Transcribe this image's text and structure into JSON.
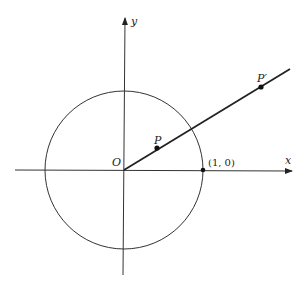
{
  "diagram": {
    "type": "unit-circle-with-ray",
    "axes": {
      "x_label": "x",
      "y_label": "y"
    },
    "origin_label": "O",
    "circle": {
      "center": "O",
      "radius": 1
    },
    "points": [
      {
        "id": "P",
        "label": "P",
        "description": "point on ray inside unit circle"
      },
      {
        "id": "P_prime",
        "label": "P′",
        "description": "point on ray outside unit circle"
      },
      {
        "id": "unit_x",
        "label": "(1, 0)",
        "description": "intersection of circle with positive x-axis"
      }
    ],
    "ray": {
      "from": "O",
      "through": [
        "P",
        "P′"
      ]
    },
    "colors": {
      "ink": "#222222",
      "background": "#ffffff"
    }
  }
}
